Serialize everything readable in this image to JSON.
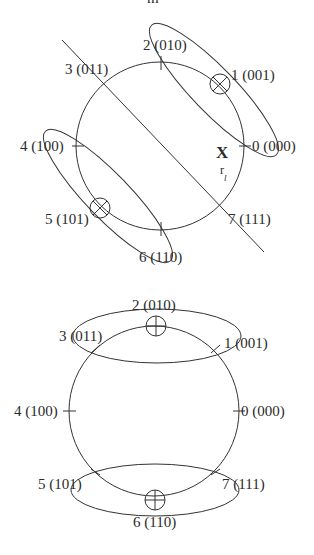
{
  "figure": {
    "top_fragment": "m",
    "colors": {
      "ink": "#333333",
      "background": "#ffffff"
    }
  },
  "diagram_top": {
    "circle": {
      "cx": 160,
      "cy": 146,
      "r": 84
    },
    "states": [
      {
        "index": "0",
        "bits": "(000)",
        "label": "0 (000)"
      },
      {
        "index": "1",
        "bits": "(001)",
        "label": "1  (001)"
      },
      {
        "index": "2",
        "bits": "(010)",
        "label": "2 (010)"
      },
      {
        "index": "3",
        "bits": "(011)",
        "label": "3 (011)"
      },
      {
        "index": "4",
        "bits": "(100)",
        "label": "4  (100)"
      },
      {
        "index": "5",
        "bits": "(101)",
        "label": "5  (101)"
      },
      {
        "index": "6",
        "bits": "(110)",
        "label": "6 (110)"
      },
      {
        "index": "7",
        "bits": "(111)",
        "label": "7  (111)"
      }
    ],
    "received_point": {
      "label": "X",
      "sublabel_main": "r",
      "sublabel_sub": "l"
    },
    "marked_points": [
      "1",
      "5"
    ],
    "marker_type": "circled-cross",
    "ellipses": [
      {
        "contains": [
          "2",
          "1",
          "0"
        ],
        "cx": 214,
        "cy": 90,
        "rx": 90,
        "ry": 22,
        "angle": 46
      },
      {
        "contains": [
          "4",
          "5",
          "6"
        ],
        "cx": 108,
        "cy": 196,
        "rx": 90,
        "ry": 22,
        "angle": 46
      }
    ],
    "decision_line": {
      "x1": 62,
      "y1": 40,
      "x2": 264,
      "y2": 252
    }
  },
  "diagram_bottom": {
    "circle": {
      "cx": 154,
      "cy": 411,
      "r": 85
    },
    "states": [
      {
        "index": "0",
        "bits": "(000)",
        "label": "0 (000)"
      },
      {
        "index": "1",
        "bits": "(001)",
        "label": "1  (001)"
      },
      {
        "index": "2",
        "bits": "(010)",
        "label": "2 (010)"
      },
      {
        "index": "3",
        "bits": "(011)",
        "label": "3 (011)"
      },
      {
        "index": "4",
        "bits": "(100)",
        "label": "4  (100)"
      },
      {
        "index": "5",
        "bits": "(101)",
        "label": "5  (101)"
      },
      {
        "index": "6",
        "bits": "(110)",
        "label": "6 (110)"
      },
      {
        "index": "7",
        "bits": "(111)",
        "label": "7  (111)"
      }
    ],
    "marked_points": [
      "2",
      "6"
    ],
    "marker_type": "circled-plus",
    "ellipses": [
      {
        "contains": [
          "3",
          "2",
          "1"
        ],
        "cx": 157,
        "cy": 336,
        "rx": 84,
        "ry": 27,
        "angle": 0
      },
      {
        "contains": [
          "5",
          "6",
          "7"
        ],
        "cx": 155,
        "cy": 490,
        "rx": 84,
        "ry": 26,
        "angle": 0
      }
    ]
  }
}
